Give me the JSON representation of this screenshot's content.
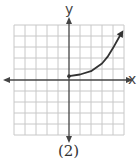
{
  "figure": {
    "caption": "(2)",
    "x_axis_label": "x",
    "y_axis_label": "y",
    "colors": {
      "grid": "#c8c8c8",
      "axis": "#444444",
      "curve": "#333333",
      "background": "#ffffff"
    }
  },
  "chart_data": {
    "type": "line",
    "title": "",
    "caption": "(2)",
    "xlabel": "x",
    "ylabel": "y",
    "xlim": [
      -5,
      5
    ],
    "ylim": [
      -5,
      5
    ],
    "grid": true,
    "axes_arrows": true,
    "series": [
      {
        "name": "curve",
        "start_point": {
          "x": 0,
          "y": 0.35,
          "marker": "dot"
        },
        "end": "arrow",
        "x": [
          0,
          1,
          2,
          3,
          3.5,
          4,
          4.5,
          4.8
        ],
        "y": [
          0.35,
          0.5,
          0.8,
          1.5,
          2.1,
          2.9,
          3.8,
          4.3
        ]
      }
    ]
  }
}
